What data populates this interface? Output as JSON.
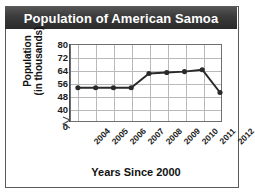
{
  "chart_title": "Population of American Samoa",
  "axis_titles": {
    "y_line1": "Population",
    "y_line2": "(in thousands)",
    "x": "Years Since 2000"
  },
  "y_ticks": [
    "80",
    "72",
    "64",
    "56",
    "48",
    "40",
    "0"
  ],
  "x_ticks": [
    "2004",
    "2005",
    "2006",
    "2007",
    "2008",
    "2009",
    "2010",
    "2011",
    "2012"
  ],
  "colors": {
    "title_bar": "#2b2b2b",
    "title_text": "#ffffff",
    "line": "#2a2a2a",
    "grid": "#b9b9b9",
    "axis": "#4a4a4a",
    "border": "#5a5a5a",
    "background": "#ffffff"
  },
  "chart_data": {
    "type": "line",
    "title": "Population of American Samoa",
    "xlabel": "Years Since 2000",
    "ylabel": "Population (in thousands)",
    "categories": [
      "2004",
      "2005",
      "2006",
      "2007",
      "2008",
      "2009",
      "2010",
      "2011",
      "2012"
    ],
    "values": [
      57.5,
      57.5,
      57.5,
      57.5,
      65,
      65.5,
      66,
      67,
      55
    ],
    "ylim": [
      40,
      80
    ],
    "y_tick_values": [
      40,
      48,
      56,
      64,
      72,
      80
    ],
    "y_axis_break": true,
    "y_break_label": "0",
    "grid": true,
    "legend": "none",
    "marker": "filled-circle",
    "series": [
      {
        "name": "Population (in thousands)",
        "values": [
          57.5,
          57.5,
          57.5,
          57.5,
          65,
          65.5,
          66,
          67,
          55
        ]
      }
    ]
  }
}
